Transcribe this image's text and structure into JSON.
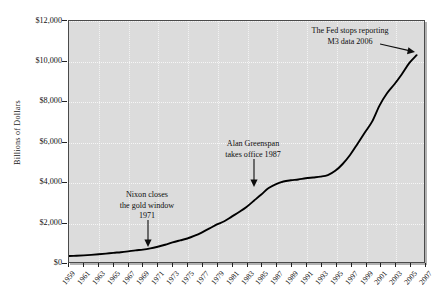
{
  "chart_data": {
    "type": "line",
    "title": "",
    "subtitle": "",
    "xlabel": "",
    "ylabel": "Billions of Dollars",
    "grid": true,
    "legend": "none",
    "xlim": [
      1959,
      2007
    ],
    "ylim": [
      0,
      12000
    ],
    "ytick_labels": [
      "$12,000",
      "$10,000",
      "$8,000",
      "$6,000",
      "$4,000",
      "$2,000",
      "$0"
    ],
    "ytick_values": [
      12000,
      10000,
      8000,
      6000,
      4000,
      2000,
      0
    ],
    "xtick_labels": [
      "1959",
      "1961",
      "1963",
      "1965",
      "1967",
      "1969",
      "1971",
      "1973",
      "1975",
      "1977",
      "1979",
      "1981",
      "1983",
      "1985",
      "1987",
      "1989",
      "1991",
      "1993",
      "1995",
      "1997",
      "1999",
      "2001",
      "2003",
      "2005",
      "2007"
    ],
    "x": [
      1959,
      1960,
      1961,
      1962,
      1963,
      1964,
      1965,
      1966,
      1967,
      1968,
      1969,
      1970,
      1971,
      1972,
      1973,
      1974,
      1975,
      1976,
      1977,
      1978,
      1979,
      1980,
      1981,
      1982,
      1983,
      1984,
      1985,
      1986,
      1987,
      1988,
      1989,
      1990,
      1991,
      1992,
      1993,
      1994,
      1995,
      1996,
      1997,
      1998,
      1999,
      2000,
      2001,
      2002,
      2003,
      2004,
      2005,
      2006
    ],
    "series": [
      {
        "name": "M3 Money Supply",
        "values": [
          300,
          312,
          330,
          355,
          385,
          418,
          455,
          487,
          530,
          580,
          615,
          675,
          760,
          860,
          975,
          1075,
          1170,
          1310,
          1480,
          1670,
          1870,
          2030,
          2260,
          2490,
          2740,
          3050,
          3360,
          3680,
          3880,
          4010,
          4070,
          4110,
          4170,
          4210,
          4250,
          4330,
          4540,
          4880,
          5330,
          5880,
          6450,
          7000,
          7800,
          8400,
          8850,
          9350,
          9900,
          10300
        ]
      }
    ],
    "annotations": [
      {
        "id": "nixon",
        "lines": [
          "Nixon closes",
          "the gold window",
          "1971"
        ],
        "points_to_year": 1971,
        "arrow_direction": "down"
      },
      {
        "id": "greenspan",
        "lines": [
          "Alan Greenspan",
          "takes office 1987"
        ],
        "points_to_year": 1987,
        "arrow_direction": "down"
      },
      {
        "id": "fed-m3",
        "lines": [
          "The Fed stops reporting",
          "M3 data 2006"
        ],
        "points_to_year": 2006,
        "arrow_direction": "right"
      }
    ],
    "colors": {
      "plot_background": "#dcdcdc",
      "line": "#000000",
      "frame": "#4a4a4a",
      "text": "#111111",
      "gridline": "#ffffff"
    }
  }
}
